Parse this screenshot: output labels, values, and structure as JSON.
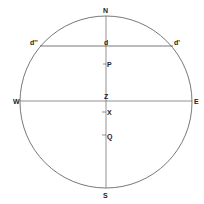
{
  "diagram": {
    "type": "celestial-sphere",
    "circle": {
      "cx": 106,
      "cy": 102,
      "r": 86,
      "stroke": "#555555"
    },
    "labels": {
      "north": "N",
      "south": "S",
      "west": "W",
      "east": "E",
      "zenith": "Z",
      "d": "d",
      "d_prime": "d'",
      "d_double_prime": "d''",
      "p": "P",
      "x": "X",
      "q": "Q"
    },
    "lines": {
      "meridian": {
        "x": 106,
        "y1": 16,
        "y2": 188
      },
      "horizon": {
        "y": 101,
        "x1": 20,
        "x2": 192
      },
      "declination_chord": {
        "y": 46,
        "x1": 40,
        "x2": 173
      }
    },
    "points": {
      "P": {
        "y": 64
      },
      "X": {
        "y": 112
      },
      "Q": {
        "y": 135
      }
    }
  }
}
